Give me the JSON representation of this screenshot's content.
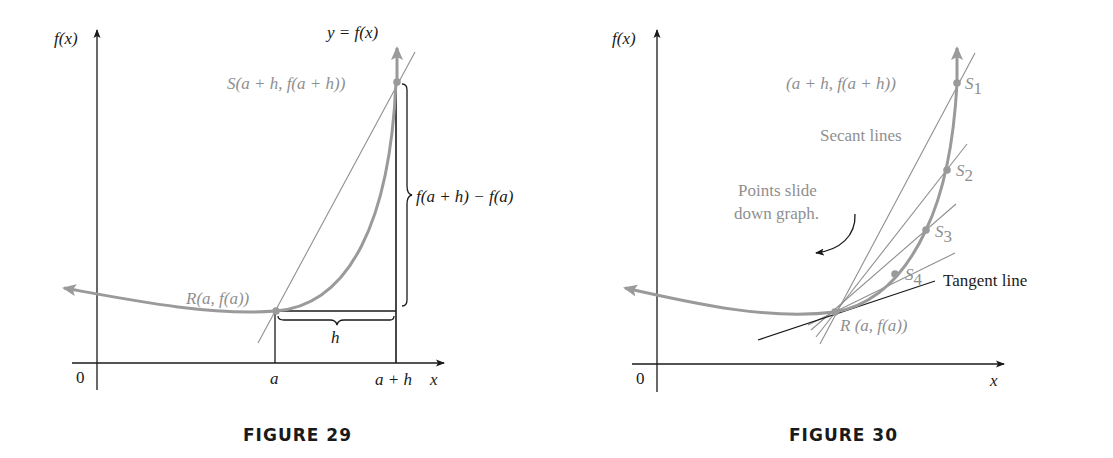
{
  "colors": {
    "ink": "#1a1a1a",
    "curve": "#9a9a9a",
    "label_gray": "#8f8f8f"
  },
  "figure29": {
    "caption": "FIGURE 29",
    "y_axis_label": "f(x)",
    "x_axis_label": "x",
    "origin_label": "0",
    "curve_label": "y = f(x)",
    "point_S_label": "S(a + h, f(a + h))",
    "point_R_label": "R(a, f(a))",
    "rise_label": "f(a + h) − f(a)",
    "run_label": "h",
    "tick_a": "a",
    "tick_a_plus_h": "a + h"
  },
  "figure30": {
    "caption": "FIGURE 30",
    "y_axis_label": "f(x)",
    "x_axis_label": "x",
    "origin_label": "0",
    "point_label_top": "(a + h, f(a + h))",
    "secant_label": "Secant lines",
    "slide_note_line1": "Points slide",
    "slide_note_line2": "down graph.",
    "tangent_label": "Tangent line",
    "point_R_label": "R (a, f(a))",
    "points": [
      {
        "name": "S",
        "sub": "1"
      },
      {
        "name": "S",
        "sub": "2"
      },
      {
        "name": "S",
        "sub": "3"
      },
      {
        "name": "S",
        "sub": "4"
      }
    ]
  }
}
